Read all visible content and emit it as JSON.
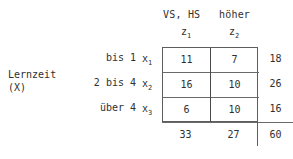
{
  "table": {
    "column_group_header": "VS, HS   höher",
    "row_group_caption": "Lernzeit\n(X)",
    "column_variables": [
      {
        "name": "z",
        "index": "1"
      },
      {
        "name": "z",
        "index": "2"
      }
    ],
    "row_variables": [
      {
        "name": "x",
        "index": "1"
      },
      {
        "name": "x",
        "index": "2"
      },
      {
        "name": "x",
        "index": "3"
      }
    ],
    "row_labels": [
      "bis 1",
      "2 bis 4",
      "über 4"
    ],
    "cells": [
      [
        "11",
        "7"
      ],
      [
        "16",
        "10"
      ],
      [
        "6",
        "10"
      ]
    ],
    "row_totals": [
      "18",
      "26",
      "16"
    ],
    "column_totals": [
      "33",
      "27"
    ],
    "grand_total": "60"
  },
  "chart_data": {
    "type": "table",
    "title": "",
    "row_variable": "Lernzeit (X)",
    "column_variable": "VS, HS / höher",
    "categories_rows": [
      "bis 1",
      "2 bis 4",
      "über 4"
    ],
    "categories_columns": [
      "z1",
      "z2"
    ],
    "values": [
      [
        11,
        7
      ],
      [
        16,
        10
      ],
      [
        6,
        10
      ]
    ],
    "row_totals": [
      18,
      26,
      16
    ],
    "column_totals": [
      33,
      27
    ],
    "grand_total": 60
  }
}
